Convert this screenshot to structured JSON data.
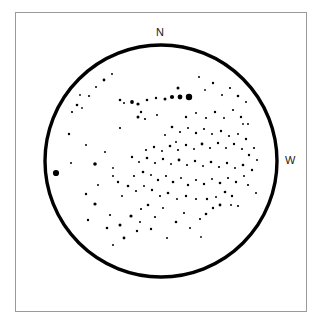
{
  "chart_data": {
    "type": "scatter",
    "title": "",
    "subtitle": "",
    "xlabel": "",
    "ylabel": "",
    "grid": false,
    "legend": null,
    "projection": "field-of-view circle",
    "field_circle": {
      "center_x": 161,
      "center_y": 161,
      "radius": 116,
      "stroke_color": "#000000",
      "stroke_width": 3.4
    },
    "frame": {
      "x": 15,
      "y": 12,
      "width": 292,
      "height": 300,
      "stroke_color": "#9a9a9a",
      "stroke_width": 1
    },
    "axis_ranges": {
      "x": [
        15,
        307
      ],
      "y": [
        12,
        312
      ]
    },
    "magnitude_scale": {
      "note": "dot radius in px encodes brightness; larger = brighter",
      "bright": 3.1,
      "medium": 2.0,
      "faint": 1.25,
      "very_faint": 0.8
    },
    "annotations": [
      {
        "text": "N",
        "x": 161,
        "y": 32,
        "meaning": "north"
      },
      {
        "text": "W",
        "x": 290,
        "y": 161,
        "meaning": "west"
      }
    ],
    "star_count": 148,
    "stars": [
      {
        "x": 56,
        "y": 173,
        "r": 3.1
      },
      {
        "x": 189,
        "y": 97,
        "r": 3.2
      },
      {
        "x": 180,
        "y": 97,
        "r": 2.4
      },
      {
        "x": 172,
        "y": 97,
        "r": 2.1
      },
      {
        "x": 165,
        "y": 99,
        "r": 1.5
      },
      {
        "x": 178,
        "y": 88,
        "r": 1.5
      },
      {
        "x": 156,
        "y": 98,
        "r": 1.2
      },
      {
        "x": 147,
        "y": 100,
        "r": 1.3
      },
      {
        "x": 138,
        "y": 104,
        "r": 1.6
      },
      {
        "x": 132,
        "y": 102,
        "r": 1.9
      },
      {
        "x": 124,
        "y": 103,
        "r": 1.0
      },
      {
        "x": 120,
        "y": 100,
        "r": 1.3
      },
      {
        "x": 141,
        "y": 112,
        "r": 1.2
      },
      {
        "x": 138,
        "y": 117,
        "r": 1.5
      },
      {
        "x": 145,
        "y": 119,
        "r": 1.1
      },
      {
        "x": 104,
        "y": 80,
        "r": 1.4
      },
      {
        "x": 112,
        "y": 74,
        "r": 1.0
      },
      {
        "x": 96,
        "y": 87,
        "r": 1.0
      },
      {
        "x": 89,
        "y": 96,
        "r": 1.1
      },
      {
        "x": 80,
        "y": 95,
        "r": 0.9
      },
      {
        "x": 77,
        "y": 105,
        "r": 1.3
      },
      {
        "x": 82,
        "y": 108,
        "r": 0.9
      },
      {
        "x": 72,
        "y": 112,
        "r": 1.1
      },
      {
        "x": 69,
        "y": 134,
        "r": 1.2
      },
      {
        "x": 86,
        "y": 145,
        "r": 1.0
      },
      {
        "x": 71,
        "y": 163,
        "r": 1.0
      },
      {
        "x": 95,
        "y": 164,
        "r": 1.8
      },
      {
        "x": 86,
        "y": 194,
        "r": 1.2
      },
      {
        "x": 95,
        "y": 204,
        "r": 1.6
      },
      {
        "x": 88,
        "y": 220,
        "r": 1.2
      },
      {
        "x": 110,
        "y": 215,
        "r": 1.1
      },
      {
        "x": 107,
        "y": 228,
        "r": 1.3
      },
      {
        "x": 120,
        "y": 225,
        "r": 1.5
      },
      {
        "x": 124,
        "y": 238,
        "r": 1.4
      },
      {
        "x": 113,
        "y": 245,
        "r": 1.0
      },
      {
        "x": 131,
        "y": 216,
        "r": 1.6
      },
      {
        "x": 140,
        "y": 222,
        "r": 1.0
      },
      {
        "x": 137,
        "y": 231,
        "r": 1.2
      },
      {
        "x": 151,
        "y": 229,
        "r": 1.2
      },
      {
        "x": 155,
        "y": 217,
        "r": 1.1
      },
      {
        "x": 163,
        "y": 208,
        "r": 1.0
      },
      {
        "x": 148,
        "y": 205,
        "r": 1.3
      },
      {
        "x": 141,
        "y": 209,
        "r": 1.1
      },
      {
        "x": 176,
        "y": 222,
        "r": 1.3
      },
      {
        "x": 184,
        "y": 213,
        "r": 1.1
      },
      {
        "x": 190,
        "y": 228,
        "r": 1.0
      },
      {
        "x": 200,
        "y": 219,
        "r": 1.1
      },
      {
        "x": 206,
        "y": 214,
        "r": 1.3
      },
      {
        "x": 213,
        "y": 208,
        "r": 1.2
      },
      {
        "x": 220,
        "y": 205,
        "r": 1.4
      },
      {
        "x": 231,
        "y": 205,
        "r": 1.0
      },
      {
        "x": 238,
        "y": 206,
        "r": 1.1
      },
      {
        "x": 232,
        "y": 196,
        "r": 1.2
      },
      {
        "x": 225,
        "y": 192,
        "r": 1.3
      },
      {
        "x": 216,
        "y": 197,
        "r": 1.0
      },
      {
        "x": 207,
        "y": 199,
        "r": 1.2
      },
      {
        "x": 196,
        "y": 199,
        "r": 1.1
      },
      {
        "x": 186,
        "y": 196,
        "r": 1.2
      },
      {
        "x": 177,
        "y": 199,
        "r": 1.0
      },
      {
        "x": 168,
        "y": 193,
        "r": 1.3
      },
      {
        "x": 160,
        "y": 196,
        "r": 1.1
      },
      {
        "x": 152,
        "y": 190,
        "r": 1.2
      },
      {
        "x": 144,
        "y": 186,
        "r": 1.0
      },
      {
        "x": 136,
        "y": 191,
        "r": 1.1
      },
      {
        "x": 128,
        "y": 186,
        "r": 1.3
      },
      {
        "x": 122,
        "y": 196,
        "r": 1.0
      },
      {
        "x": 118,
        "y": 182,
        "r": 1.2
      },
      {
        "x": 113,
        "y": 176,
        "r": 1.0
      },
      {
        "x": 134,
        "y": 176,
        "r": 1.1
      },
      {
        "x": 143,
        "y": 172,
        "r": 1.3
      },
      {
        "x": 151,
        "y": 175,
        "r": 1.0
      },
      {
        "x": 158,
        "y": 180,
        "r": 1.2
      },
      {
        "x": 166,
        "y": 176,
        "r": 1.1
      },
      {
        "x": 173,
        "y": 182,
        "r": 1.3
      },
      {
        "x": 181,
        "y": 178,
        "r": 1.0
      },
      {
        "x": 188,
        "y": 185,
        "r": 1.2
      },
      {
        "x": 196,
        "y": 180,
        "r": 1.1
      },
      {
        "x": 204,
        "y": 184,
        "r": 1.2
      },
      {
        "x": 212,
        "y": 179,
        "r": 1.0
      },
      {
        "x": 220,
        "y": 183,
        "r": 1.3
      },
      {
        "x": 228,
        "y": 178,
        "r": 1.1
      },
      {
        "x": 236,
        "y": 182,
        "r": 1.2
      },
      {
        "x": 244,
        "y": 176,
        "r": 1.0
      },
      {
        "x": 248,
        "y": 185,
        "r": 1.1
      },
      {
        "x": 252,
        "y": 170,
        "r": 1.2
      },
      {
        "x": 243,
        "y": 165,
        "r": 1.3
      },
      {
        "x": 235,
        "y": 168,
        "r": 1.0
      },
      {
        "x": 227,
        "y": 163,
        "r": 1.2
      },
      {
        "x": 219,
        "y": 167,
        "r": 1.1
      },
      {
        "x": 211,
        "y": 162,
        "r": 1.3
      },
      {
        "x": 203,
        "y": 166,
        "r": 1.0
      },
      {
        "x": 195,
        "y": 161,
        "r": 1.2
      },
      {
        "x": 187,
        "y": 165,
        "r": 1.1
      },
      {
        "x": 179,
        "y": 160,
        "r": 1.4
      },
      {
        "x": 171,
        "y": 164,
        "r": 1.0
      },
      {
        "x": 163,
        "y": 159,
        "r": 1.2
      },
      {
        "x": 155,
        "y": 163,
        "r": 1.1
      },
      {
        "x": 147,
        "y": 158,
        "r": 1.3
      },
      {
        "x": 139,
        "y": 162,
        "r": 1.0
      },
      {
        "x": 132,
        "y": 157,
        "r": 1.2
      },
      {
        "x": 146,
        "y": 150,
        "r": 1.1
      },
      {
        "x": 154,
        "y": 147,
        "r": 1.2
      },
      {
        "x": 162,
        "y": 151,
        "r": 1.0
      },
      {
        "x": 170,
        "y": 146,
        "r": 1.3
      },
      {
        "x": 178,
        "y": 150,
        "r": 1.1
      },
      {
        "x": 186,
        "y": 145,
        "r": 1.2
      },
      {
        "x": 194,
        "y": 149,
        "r": 1.0
      },
      {
        "x": 202,
        "y": 144,
        "r": 1.4
      },
      {
        "x": 210,
        "y": 148,
        "r": 1.1
      },
      {
        "x": 218,
        "y": 143,
        "r": 1.2
      },
      {
        "x": 226,
        "y": 148,
        "r": 1.0
      },
      {
        "x": 234,
        "y": 144,
        "r": 1.2
      },
      {
        "x": 242,
        "y": 149,
        "r": 1.1
      },
      {
        "x": 249,
        "y": 155,
        "r": 1.2
      },
      {
        "x": 257,
        "y": 160,
        "r": 1.0
      },
      {
        "x": 254,
        "y": 148,
        "r": 1.1
      },
      {
        "x": 246,
        "y": 139,
        "r": 1.2
      },
      {
        "x": 238,
        "y": 134,
        "r": 1.0
      },
      {
        "x": 229,
        "y": 136,
        "r": 1.1
      },
      {
        "x": 221,
        "y": 131,
        "r": 1.2
      },
      {
        "x": 212,
        "y": 134,
        "r": 1.0
      },
      {
        "x": 204,
        "y": 129,
        "r": 1.1
      },
      {
        "x": 196,
        "y": 133,
        "r": 1.2
      },
      {
        "x": 188,
        "y": 128,
        "r": 1.0
      },
      {
        "x": 180,
        "y": 132,
        "r": 1.1
      },
      {
        "x": 172,
        "y": 127,
        "r": 1.3
      },
      {
        "x": 165,
        "y": 135,
        "r": 1.0
      },
      {
        "x": 176,
        "y": 142,
        "r": 1.0
      },
      {
        "x": 186,
        "y": 117,
        "r": 1.2
      },
      {
        "x": 196,
        "y": 113,
        "r": 1.0
      },
      {
        "x": 206,
        "y": 118,
        "r": 1.1
      },
      {
        "x": 215,
        "y": 112,
        "r": 1.2
      },
      {
        "x": 224,
        "y": 118,
        "r": 1.0
      },
      {
        "x": 233,
        "y": 110,
        "r": 1.1
      },
      {
        "x": 241,
        "y": 117,
        "r": 1.2
      },
      {
        "x": 248,
        "y": 124,
        "r": 1.0
      },
      {
        "x": 238,
        "y": 96,
        "r": 1.3
      },
      {
        "x": 246,
        "y": 102,
        "r": 1.0
      },
      {
        "x": 230,
        "y": 88,
        "r": 1.1
      },
      {
        "x": 222,
        "y": 95,
        "r": 1.0
      },
      {
        "x": 213,
        "y": 83,
        "r": 1.2
      },
      {
        "x": 205,
        "y": 90,
        "r": 0.9
      },
      {
        "x": 199,
        "y": 77,
        "r": 1.0
      },
      {
        "x": 157,
        "y": 115,
        "r": 1.0
      },
      {
        "x": 120,
        "y": 128,
        "r": 1.1
      },
      {
        "x": 105,
        "y": 152,
        "r": 1.0
      },
      {
        "x": 113,
        "y": 168,
        "r": 0.9
      },
      {
        "x": 98,
        "y": 185,
        "r": 1.0
      },
      {
        "x": 243,
        "y": 124,
        "r": 0.9
      },
      {
        "x": 256,
        "y": 193,
        "r": 1.0
      },
      {
        "x": 167,
        "y": 238,
        "r": 1.0
      },
      {
        "x": 201,
        "y": 237,
        "r": 0.9
      }
    ]
  },
  "labels": {
    "north": "N",
    "west": "W"
  },
  "colors": {
    "star": "#000000",
    "circle": "#000000",
    "frame": "#9a9a9a",
    "background": "#ffffff",
    "text": "#1a1a1a"
  }
}
